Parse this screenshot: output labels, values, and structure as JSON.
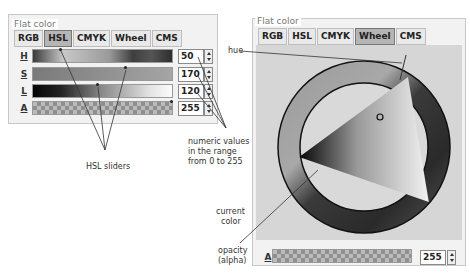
{
  "left_panel": {
    "title": "Flat color",
    "tabs": [
      {
        "label": "RGB",
        "active": false
      },
      {
        "label": "HSL",
        "active": true
      },
      {
        "label": "CMYK",
        "active": false
      },
      {
        "label": "Wheel",
        "active": false
      },
      {
        "label": "CMS",
        "active": false
      }
    ],
    "sliders": [
      {
        "label": "H",
        "value": "50"
      },
      {
        "label": "S",
        "value": "170"
      },
      {
        "label": "L",
        "value": "120"
      },
      {
        "label": "A",
        "value": "255"
      }
    ]
  },
  "right_panel": {
    "title": "Flat color",
    "tabs": [
      {
        "label": "RGB",
        "active": false
      },
      {
        "label": "HSL",
        "active": false
      },
      {
        "label": "CMYK",
        "active": false
      },
      {
        "label": "Wheel",
        "active": true
      },
      {
        "label": "CMS",
        "active": false
      }
    ],
    "alpha": {
      "label": "A",
      "value": "255"
    }
  },
  "annotations": {
    "hue": "hue",
    "numeric_values": [
      "numeric values",
      "in the range",
      "from 0 to 255"
    ],
    "hsl_sliders": "HSL sliders",
    "current_color": [
      "current",
      "color"
    ],
    "opacity": [
      "opacity",
      "(alpha)"
    ]
  },
  "colors": {
    "panel_bg": "#f2f2f2",
    "active_tab": "#b5b5b5",
    "ring_dark": "#2b2b2b"
  }
}
